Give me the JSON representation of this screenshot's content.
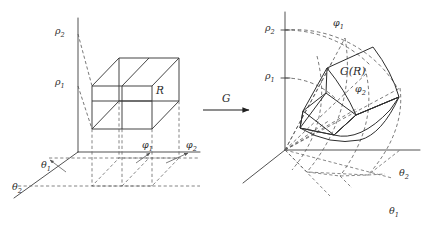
{
  "figure": {
    "background_color": "#ffffff",
    "line_color": "#333333",
    "dash_color": "#555555",
    "width": 428,
    "height": 232
  },
  "arrow": {
    "label": "G",
    "name": "transformation-arrow"
  },
  "left_panel": {
    "name": "domain-box-diagram",
    "region_label": "R",
    "vertical_axis_labels": [
      {
        "label": "ρ",
        "sub": "2"
      },
      {
        "label": "ρ",
        "sub": "1"
      }
    ],
    "left_axis_labels": [
      {
        "label": "θ",
        "sub": "1"
      },
      {
        "label": "θ",
        "sub": "2"
      }
    ],
    "right_axis_labels": [
      {
        "label": "φ",
        "sub": "1"
      },
      {
        "label": "φ",
        "sub": "2"
      }
    ]
  },
  "right_panel": {
    "name": "image-wedge-diagram",
    "region_label": "G(R)",
    "vertical_axis_labels": [
      {
        "label": "ρ",
        "sub": "2"
      },
      {
        "label": "ρ",
        "sub": "1"
      }
    ],
    "ray_labels": [
      {
        "label": "φ",
        "sub": "1"
      },
      {
        "label": "φ",
        "sub": "2"
      }
    ],
    "base_labels": [
      {
        "label": "θ",
        "sub": "2"
      },
      {
        "label": "θ",
        "sub": "1"
      }
    ]
  }
}
